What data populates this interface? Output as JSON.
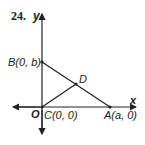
{
  "problem_number": "24.",
  "axes": {
    "x_label": "x",
    "y_label": "y",
    "origin_label": "O"
  },
  "points": {
    "B": "B(0, b)",
    "C": "C(0, 0)",
    "A": "A(a, 0)",
    "D": "D"
  },
  "colors": {
    "stroke": "#222222",
    "background": "#ffffff"
  }
}
